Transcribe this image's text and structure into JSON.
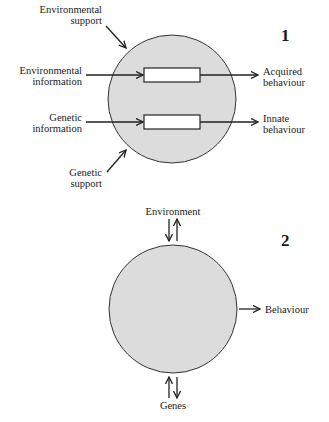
{
  "figure": {
    "diagram1": {
      "number": "1",
      "labels": {
        "environmental_support": [
          "Environmental",
          "support"
        ],
        "environmental_information": [
          "Environmental",
          "information"
        ],
        "genetic_information": [
          "Genetic",
          "information"
        ],
        "genetic_support": [
          "Genetic",
          "support"
        ],
        "acquired_behaviour": [
          "Acquired",
          "behaviour"
        ],
        "innate_behaviour": [
          "Innate",
          "behaviour"
        ]
      }
    },
    "diagram2": {
      "number": "2",
      "labels": {
        "environment": "Environment",
        "behaviour": "Behaviour",
        "genes": "Genes"
      }
    },
    "colors": {
      "circle_fill": "#dcdcdc",
      "stroke": "#222222",
      "box_fill": "#ffffff"
    }
  }
}
